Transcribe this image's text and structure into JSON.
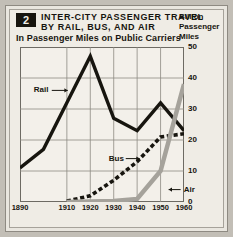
{
  "header": {
    "badge": "2",
    "title_line1": "INTER-CITY  PASSENGER  TRAVEL",
    "title_line2": "BY  RAIL,  BUS,  AND  AIR",
    "subtitle": "In Passenger Miles on Public Carriers",
    "unit_line1": "Billion",
    "unit_line2": "Passenger",
    "unit_line3": "Miles"
  },
  "chart_data": {
    "type": "line",
    "title": "INTER-CITY PASSENGER TRAVEL BY RAIL, BUS, AND AIR",
    "subtitle": "In Passenger Miles on Public Carriers",
    "xlabel": "",
    "ylabel": "Billion Passenger Miles",
    "xlim": [
      1890,
      1960
    ],
    "ylim": [
      0,
      50
    ],
    "grid": true,
    "legend": "inline-annotations",
    "xticks": [
      "1890",
      "1910",
      "1920",
      "1930",
      "1940",
      "1950",
      "1960"
    ],
    "xtick_values": [
      1890,
      1910,
      1920,
      1930,
      1940,
      1950,
      1960
    ],
    "yticks": [
      "0",
      "10",
      "20",
      "30",
      "40",
      "50"
    ],
    "ytick_values": [
      0,
      10,
      20,
      30,
      40,
      50
    ],
    "series": [
      {
        "name": "Rail",
        "style": "solid-thick-black",
        "color": "#17150f",
        "x": [
          1890,
          1900,
          1910,
          1920,
          1930,
          1940,
          1950,
          1960
        ],
        "values": [
          11,
          17,
          32,
          47,
          27,
          23,
          32,
          23
        ]
      },
      {
        "name": "Bus",
        "style": "dashed-thick-black",
        "color": "#17150f",
        "x": [
          1910,
          1920,
          1930,
          1940,
          1950,
          1960
        ],
        "values": [
          0.3,
          2,
          7,
          13,
          21,
          22
        ]
      },
      {
        "name": "Air",
        "style": "solid-thick-gray",
        "color": "#a5a29b",
        "x": [
          1910,
          1930,
          1940,
          1950,
          1960
        ],
        "values": [
          0,
          0.3,
          1,
          10,
          38
        ]
      }
    ],
    "annotations": [
      {
        "label": "Rail",
        "x": 1901,
        "y": 36
      },
      {
        "label": "Bus",
        "x": 1933,
        "y": 14
      },
      {
        "label": "Air",
        "x": 1956,
        "y": 4
      }
    ]
  }
}
